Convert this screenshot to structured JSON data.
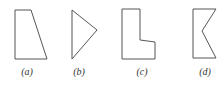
{
  "figure": {
    "shapes": [
      {
        "id": "a",
        "label": "(a)",
        "description": "right trapezoid",
        "points": "15,10 31,10 47,59 15,59",
        "label_x": 27
      },
      {
        "id": "b",
        "label": "(b)",
        "description": "triangle",
        "points": "72,10 97,30 72,59",
        "label_x": 79
      },
      {
        "id": "c",
        "label": "(c)",
        "description": "L-shaped polygon",
        "points": "122,9 140,9 140,40 155,42 155,59 122,59",
        "label_x": 142
      },
      {
        "id": "d",
        "label": "(d)",
        "description": "concave notched pentagon",
        "points": "193,9 216,9 202,31 216,58 193,58",
        "label_x": 205
      }
    ],
    "stroke_color": "#555555",
    "label_color": "#333333"
  }
}
